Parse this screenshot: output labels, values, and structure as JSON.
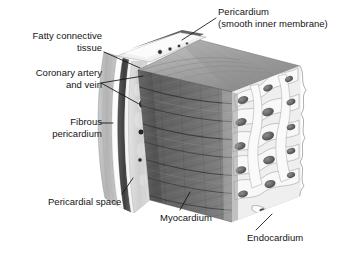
{
  "figure": {
    "type": "anatomical-illustration",
    "background_color": "#ffffff",
    "text_color": "#141414",
    "leader_line_color": "#111111"
  },
  "labels": {
    "fatty_connective_tissue": {
      "line1": "Fatty connective",
      "line2": "tissue",
      "align": "right"
    },
    "coronary_vessels": {
      "line1": "Coronary artery",
      "line2": "and vein",
      "align": "right"
    },
    "fibrous_pericardium": {
      "line1": "Fibrous",
      "line2": "pericardium",
      "align": "right"
    },
    "pericardium": {
      "line1": "Pericardium",
      "line2": "(smooth inner membrane)",
      "align": "left"
    },
    "pericardial_space": {
      "line1": "Pericardial space",
      "align": "left"
    },
    "myocardium": {
      "line1": "Myocardium",
      "align": "left"
    },
    "endocardium": {
      "line1": "Endocardium",
      "align": "left"
    }
  },
  "structures": {
    "pericardium_outer_band": {
      "name": "fibrous pericardium band",
      "color": "#b9b9b9"
    },
    "pericardial_space_band": {
      "name": "pericardial space (white gap)",
      "color": "#fbfbfb"
    },
    "serous_membrane_band": {
      "name": "smooth inner serous membrane",
      "color": "#6a6a6a"
    },
    "fat_band": {
      "name": "fatty connective tissue",
      "color": "#d5d5d5"
    },
    "myocardium": {
      "name": "myocardium (cardiac muscle)",
      "color": "#6e6e6e",
      "texture": "diagonal muscle fiber striations"
    },
    "myocardium_top_face": {
      "name": "myocardium cut top face",
      "color": "#9a9a9a"
    },
    "endocardium": {
      "name": "endocardium (trabeculated inner lining)",
      "color": "#ededed",
      "texture": "sponge-like trabeculae carneae"
    },
    "coronary_vessels": {
      "name": "coronary artery and vein lumens",
      "color": "#1e1e1e",
      "count": 2
    }
  }
}
